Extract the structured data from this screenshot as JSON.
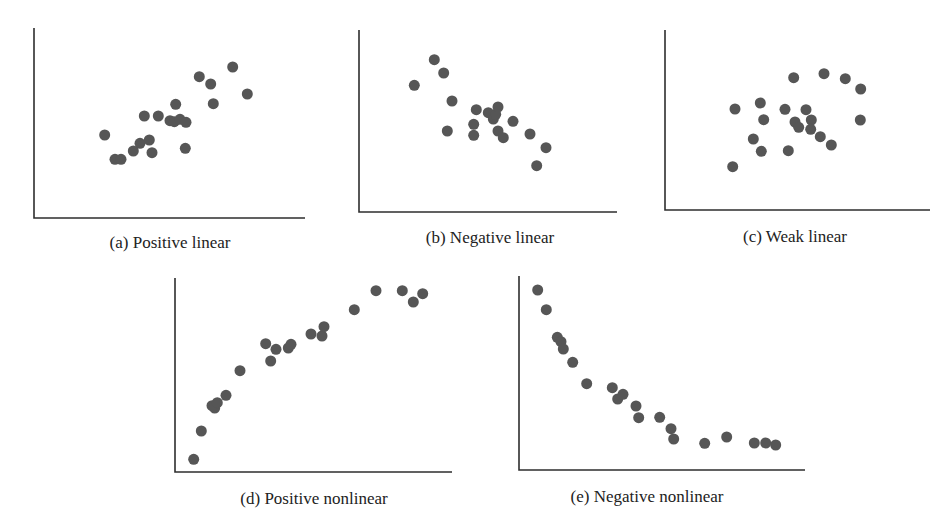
{
  "figure": {
    "width": 948,
    "height": 528,
    "dot_color": "#565656",
    "axis_color": "#2e2e2e",
    "dot_radius": 5.5
  },
  "chart_data": [
    {
      "type": "scatter",
      "id": "a",
      "title": "(a) Positive linear",
      "xlabel": "",
      "ylabel": "",
      "grid": false,
      "frame": {
        "x0": 34,
        "y_top": 28,
        "y_axis": 218,
        "x1": 305
      },
      "caption_pos": {
        "x": 170,
        "y": 248
      },
      "points": [
        [
          104.7,
          135
        ],
        [
          115,
          159.3
        ],
        [
          121,
          159.3
        ],
        [
          133.3,
          151
        ],
        [
          140,
          143.3
        ],
        [
          149.3,
          140
        ],
        [
          152,
          152.7
        ],
        [
          144.3,
          116
        ],
        [
          158.3,
          116
        ],
        [
          175.7,
          104.3
        ],
        [
          170,
          120.7
        ],
        [
          174.3,
          121.7
        ],
        [
          180,
          119.3
        ],
        [
          186,
          122.3
        ],
        [
          185.3,
          148.3
        ],
        [
          199.3,
          76.7
        ],
        [
          210.7,
          84
        ],
        [
          213.3,
          103.7
        ],
        [
          232.7,
          67
        ],
        [
          247.3,
          94
        ]
      ]
    },
    {
      "type": "scatter",
      "id": "b",
      "title": "(b) Negative linear",
      "xlabel": "",
      "ylabel": "",
      "grid": false,
      "frame": {
        "x0": 359,
        "y_top": 30,
        "y_axis": 212,
        "x1": 617
      },
      "caption_pos": {
        "x": 490,
        "y": 243
      },
      "points": [
        [
          414.3,
          85.3
        ],
        [
          434.3,
          59.7
        ],
        [
          443.7,
          73
        ],
        [
          452,
          101
        ],
        [
          447.3,
          131
        ],
        [
          476.3,
          109.7
        ],
        [
          473.7,
          124.3
        ],
        [
          473.7,
          135.3
        ],
        [
          488.3,
          112.7
        ],
        [
          493.3,
          119
        ],
        [
          495.7,
          114.3
        ],
        [
          498,
          107
        ],
        [
          498,
          131
        ],
        [
          503.3,
          137.7
        ],
        [
          513,
          121.3
        ],
        [
          530,
          134
        ],
        [
          546,
          147.7
        ],
        [
          536.7,
          165.7
        ]
      ]
    },
    {
      "type": "scatter",
      "id": "c",
      "title": "(c) Weak linear",
      "xlabel": "",
      "ylabel": "",
      "grid": false,
      "frame": {
        "x0": 665,
        "y_top": 30,
        "y_axis": 210,
        "x1": 930
      },
      "caption_pos": {
        "x": 795,
        "y": 242
      },
      "points": [
        [
          732.7,
          166.7
        ],
        [
          735,
          109
        ],
        [
          753.3,
          139
        ],
        [
          761.3,
          151.3
        ],
        [
          760.3,
          103
        ],
        [
          763.7,
          119.7
        ],
        [
          785,
          109.3
        ],
        [
          788.3,
          150.7
        ],
        [
          793.7,
          77.7
        ],
        [
          795,
          122
        ],
        [
          798.7,
          127.3
        ],
        [
          806,
          109.7
        ],
        [
          811.3,
          120
        ],
        [
          810.7,
          129.3
        ],
        [
          820.3,
          136.7
        ],
        [
          831.3,
          145
        ],
        [
          824,
          73.7
        ],
        [
          845.3,
          78.7
        ],
        [
          860.7,
          89
        ],
        [
          860.3,
          120
        ]
      ]
    },
    {
      "type": "scatter",
      "id": "d",
      "title": "(d) Positive nonlinear",
      "xlabel": "",
      "ylabel": "",
      "grid": false,
      "frame": {
        "x0": 175,
        "y_top": 278,
        "y_axis": 472,
        "x1": 452
      },
      "caption_pos": {
        "x": 314,
        "y": 504
      },
      "points": [
        [
          193.7,
          459.3
        ],
        [
          201.3,
          431
        ],
        [
          212,
          405.7
        ],
        [
          214.7,
          408
        ],
        [
          217.3,
          402.7
        ],
        [
          226,
          395.3
        ],
        [
          240,
          370.7
        ],
        [
          265.7,
          343.7
        ],
        [
          270.7,
          361
        ],
        [
          276,
          349.3
        ],
        [
          288.3,
          348
        ],
        [
          291,
          344.3
        ],
        [
          311,
          334
        ],
        [
          322,
          336
        ],
        [
          324,
          326.7
        ],
        [
          354.3,
          309.7
        ],
        [
          376,
          290.7
        ],
        [
          402.3,
          290.7
        ],
        [
          413.3,
          302
        ],
        [
          422.7,
          293.7
        ]
      ]
    },
    {
      "type": "scatter",
      "id": "e",
      "title": "(e) Negative nonlinear",
      "xlabel": "",
      "ylabel": "",
      "grid": false,
      "frame": {
        "x0": 519,
        "y_top": 276,
        "y_axis": 470,
        "x1": 805
      },
      "caption_pos": {
        "x": 647,
        "y": 502
      },
      "points": [
        [
          537.7,
          290
        ],
        [
          546.3,
          309.7
        ],
        [
          557.3,
          337.3
        ],
        [
          561,
          341.7
        ],
        [
          563.3,
          349
        ],
        [
          572.7,
          362.3
        ],
        [
          586.7,
          383.7
        ],
        [
          612.3,
          387.7
        ],
        [
          617.7,
          399
        ],
        [
          623,
          394.3
        ],
        [
          636,
          406
        ],
        [
          638.7,
          417.7
        ],
        [
          659.7,
          417.3
        ],
        [
          671,
          428.7
        ],
        [
          673.7,
          439
        ],
        [
          704.7,
          443.3
        ],
        [
          726.7,
          437
        ],
        [
          754.3,
          443
        ],
        [
          765.7,
          443
        ],
        [
          775.7,
          445
        ]
      ]
    }
  ],
  "captions": {
    "a": "(a) Positive linear",
    "b": "(b) Negative linear",
    "c": "(c) Weak linear",
    "d": "(d) Positive nonlinear",
    "e": "(e) Negative nonlinear"
  }
}
